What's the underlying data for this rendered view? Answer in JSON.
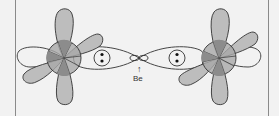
{
  "diagram": {
    "labels": {
      "center_atom": "Be",
      "arrow": "↑"
    },
    "colors": {
      "background": "#f2f2f2",
      "lobe_fill": "#bdbdbd",
      "lobe_dark": "#8c8c8c",
      "core_fill": "#a8a8a8",
      "outline": "#333333",
      "frame_line": "#8a8a8a"
    },
    "atoms": [
      {
        "name": "left-atom",
        "cx": 64,
        "cy": 58
      },
      {
        "name": "right-atom",
        "cx": 219,
        "cy": 58
      }
    ],
    "center": {
      "cx": 139,
      "cy": 58
    }
  }
}
